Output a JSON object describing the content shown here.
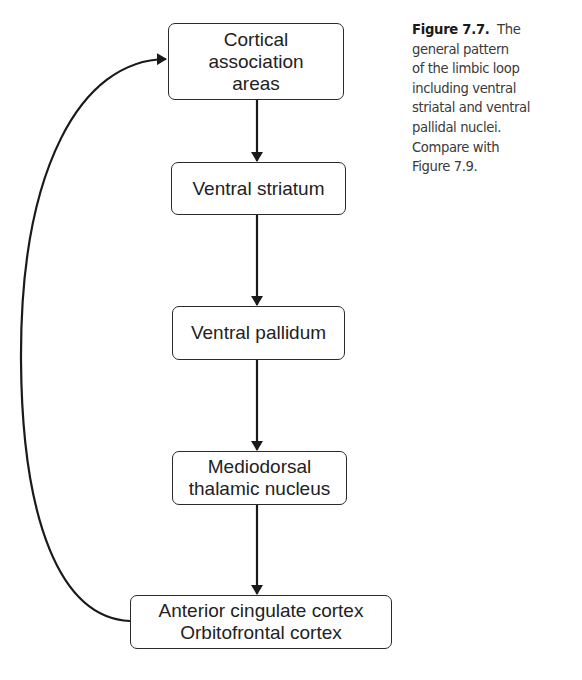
{
  "diagram": {
    "title": "General pattern of the limbic loop",
    "nodes": [
      {
        "id": "cortical",
        "lines": [
          "Cortical",
          "association",
          "areas"
        ]
      },
      {
        "id": "ventral-striatum",
        "lines": [
          "Ventral striatum"
        ]
      },
      {
        "id": "ventral-pallidum",
        "lines": [
          "Ventral pallidum"
        ]
      },
      {
        "id": "mediodorsal",
        "lines": [
          "Mediodorsal",
          "thalamic nucleus"
        ]
      },
      {
        "id": "cingulate-orbitofrontal",
        "lines": [
          "Anterior cingulate cortex",
          "Orbitofrontal cortex"
        ]
      }
    ],
    "edges": [
      {
        "from": "cortical",
        "to": "ventral-striatum"
      },
      {
        "from": "ventral-striatum",
        "to": "ventral-pallidum"
      },
      {
        "from": "ventral-pallidum",
        "to": "mediodorsal"
      },
      {
        "from": "mediodorsal",
        "to": "cingulate-orbitofrontal"
      },
      {
        "from": "cingulate-orbitofrontal",
        "to": "cortical",
        "style": "curved-feedback"
      }
    ],
    "colors": {
      "line": "#1a1a1a",
      "text": "#222222",
      "caption": "#3a3a3a"
    }
  },
  "caption": {
    "label": "Figure 7.7.",
    "lines": [
      "The",
      "general pattern",
      "of the limbic loop",
      "including ventral",
      "striatal and ventral",
      "pallidal nuclei.",
      "Compare with",
      "Figure 7.9."
    ]
  }
}
